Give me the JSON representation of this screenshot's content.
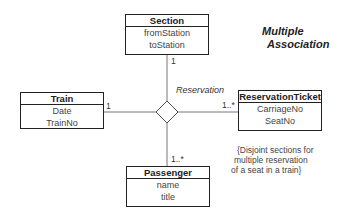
{
  "title": {
    "line1": "Multiple",
    "line2": "Association"
  },
  "association": {
    "name": "Reservation"
  },
  "classes": {
    "section": {
      "name": "Section",
      "attributes": [
        "fromStation",
        "toStation"
      ]
    },
    "train": {
      "name": "Train",
      "attributes": [
        "Date",
        "TrainNo"
      ]
    },
    "ticket": {
      "name": "ReservationTicket",
      "attributes": [
        "CarriageNo",
        "SeatNo"
      ]
    },
    "passenger": {
      "name": "Passenger",
      "attributes": [
        "name",
        "title"
      ]
    }
  },
  "multiplicities": {
    "section": "1",
    "train": "1",
    "ticket": "1..*",
    "passenger": "1..*"
  },
  "note": {
    "line1": "{Disjoint sections for",
    "line2": "multiple reservation",
    "line3": "of a seat in a train}"
  }
}
